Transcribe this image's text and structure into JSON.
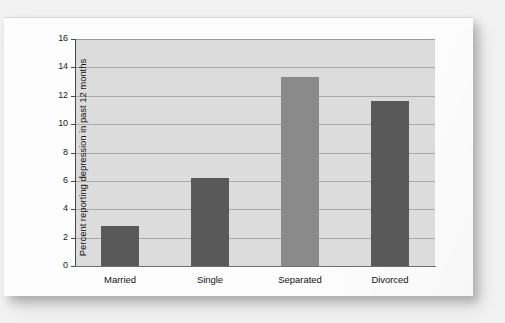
{
  "figure": {
    "kind": "printed-textbook-figure",
    "card_background": "#fdfdfd",
    "page_background": "#f2f2f2"
  },
  "chart_data": {
    "type": "bar",
    "title": "",
    "xlabel": "",
    "ylabel": "Percent reporting depression in past 12 months",
    "categories": [
      "Married",
      "Single",
      "Separated",
      "Divorced"
    ],
    "values": [
      2.8,
      6.2,
      13.3,
      11.6
    ],
    "ylim": [
      0,
      16
    ],
    "ytick_step": 2,
    "ytick_labels": [
      "0",
      "2",
      "4",
      "6",
      "8",
      "10",
      "12",
      "14",
      "16"
    ],
    "grid": "horizontal",
    "legend": "none",
    "bar_colors": [
      "#595959",
      "#595959",
      "#8a8a8a",
      "#595959"
    ],
    "plot_background": "#dcdcdc",
    "gridline_color": "#a9a9a9",
    "axis_color": "#4a4a4a"
  }
}
